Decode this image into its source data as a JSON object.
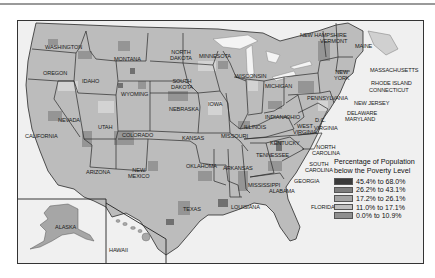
{
  "map": {
    "subject": "United States county-level poverty map",
    "legend": {
      "title_line1": "Percentage of Population",
      "title_line2": "below the Poverty Level",
      "items": [
        {
          "label": "45.4% to 68.0%",
          "color": "#3a3a3a"
        },
        {
          "label": "26.2% to  43.1%",
          "color": "#7d7d7d"
        },
        {
          "label": "17.2% to 26.1%",
          "color": "#a3a3a3"
        },
        {
          "label": "11.0% to 17.1%",
          "color": "#bfbfbf"
        },
        {
          "label": "0.0% to 10.9%",
          "color": "#8f8f8f"
        }
      ]
    },
    "state_labels": {
      "washington": "WASHINGTON",
      "oregon": "OREGON",
      "idaho": "IDAHO",
      "montana": "MONTANA",
      "wyoming": "WYOMING",
      "north_dakota_1": "NORTH",
      "north_dakota_2": "DAKOTA",
      "south_dakota_1": "SOUTH",
      "south_dakota_2": "DAKOTA",
      "minnesota": "MINNESOTA",
      "wisconsin": "WISCONSIN",
      "michigan": "MICHIGAN",
      "nevada": "NEVADA",
      "utah": "UTAH",
      "colorado": "COLORADO",
      "california": "CALIFORNIA",
      "arizona": "ARIZONA",
      "new_mexico_1": "NEW",
      "new_mexico_2": "MEXICO",
      "nebraska": "NEBRASKA",
      "kansas": "KANSAS",
      "iowa": "IOWA",
      "illinois": "ILLINOIS",
      "indiana": "INDIANA",
      "ohio": "OHIO",
      "missouri": "MISSOURI",
      "oklahoma": "OKLAHOMA",
      "arkansas": "ARKANSAS",
      "texas": "TEXAS",
      "louisiana": "LOUISIANA",
      "mississippi": "MISSISSIPPI",
      "alabama": "ALABAMA",
      "georgia": "GEORGIA",
      "florida": "FLORIDA",
      "tennessee": "TENNESSEE",
      "kentucky": "KENTUCKY",
      "west_virginia_1": "WEST",
      "west_virginia_2": "VIRGINIA",
      "virginia": "VIRGINIA",
      "dc": "D.C.",
      "north_carolina_1": "NORTH",
      "north_carolina_2": "CAROLINA",
      "south_carolina_1": "SOUTH",
      "south_carolina_2": "CAROLINA",
      "pennsylvania": "PENNSYLVANIA",
      "new_york_1": "NEW",
      "new_york_2": "YORK",
      "new_jersey": "NEW JERSEY",
      "delaware": "DELAWARE",
      "maryland": "MARYLAND",
      "new_hampshire": "NEW HAMPSHIRE",
      "vermont": "VERMONT",
      "maine": "MAINE",
      "massachusetts": "MASSACHUSETTS",
      "rhode_island": "RHODE ISLAND",
      "connecticut": "CONNECTICUT",
      "alaska": "ALASKA",
      "hawaii": "HAWAII"
    }
  }
}
